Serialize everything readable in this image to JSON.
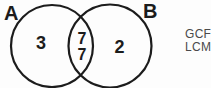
{
  "venn": {
    "set_a_label": "A",
    "set_b_label": "B",
    "a_only_value": "3",
    "intersection_value_top": "7",
    "intersection_value_bottom": "7",
    "b_only_value": "2"
  },
  "side_text": {
    "line1": "GCF",
    "line2": "LCM"
  },
  "colors": {
    "background": "#fdfdfd",
    "diagram_stroke": "#1c1c1c",
    "diagram_text": "#1c1c1c",
    "side_text_color": "#4a4a4a"
  }
}
